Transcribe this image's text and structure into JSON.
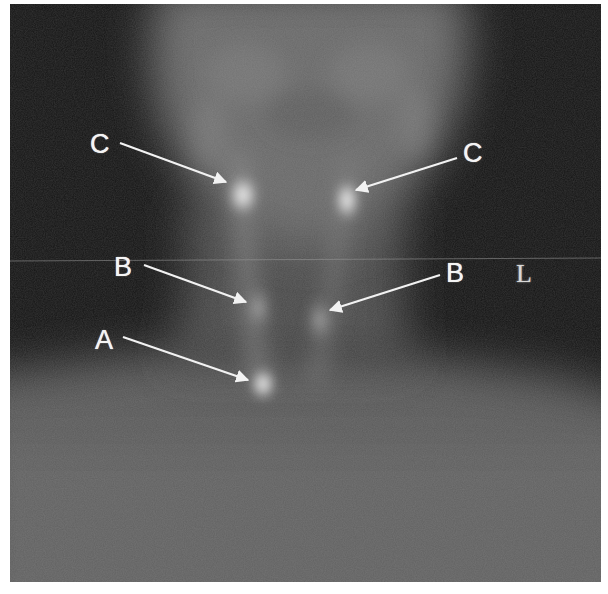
{
  "figure": {
    "type": "grayscale nuclear medicine scan (anterior neck view)",
    "orientation_marker": "L",
    "annotations": [
      {
        "id": "label-c-left",
        "text": "C",
        "points_to": "upper left focus"
      },
      {
        "id": "label-c-right",
        "text": "C",
        "points_to": "upper right focus"
      },
      {
        "id": "label-b-left",
        "text": "B",
        "points_to": "middle left focus"
      },
      {
        "id": "label-b-right",
        "text": "B",
        "points_to": "middle right focus"
      },
      {
        "id": "label-a",
        "text": "A",
        "points_to": "lower midline focus"
      }
    ],
    "colors": {
      "background": "#151515",
      "body_uptake": "#5e5e5e",
      "hot_spot": "#f2f2f2",
      "annotation": "#f4f4f4",
      "page": "#ffffff"
    }
  }
}
